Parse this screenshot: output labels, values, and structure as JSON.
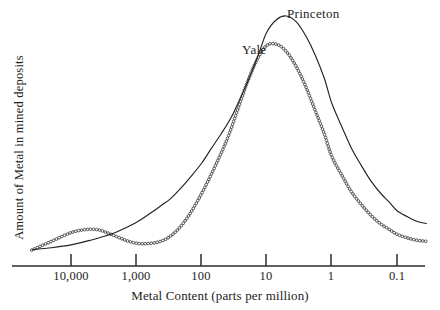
{
  "chart_data": {
    "type": "line",
    "title": "",
    "xlabel": "Metal Content (parts per million)",
    "ylabel": "Amount of Metal in mined deposits",
    "x_scale": "log-reversed",
    "x_ticks": [
      "10,000",
      "1,000",
      "100",
      "10",
      "1",
      "0.1"
    ],
    "x_tick_values": [
      10000,
      1000,
      100,
      10,
      1,
      0.1
    ],
    "xlim": [
      40000,
      0.03
    ],
    "ylim": [
      0,
      1.05
    ],
    "y_ticks": [],
    "grid": false,
    "legend": "inline-annotations",
    "annotations": [
      {
        "text": "Princeton",
        "x_px": 287,
        "y_px": 6
      },
      {
        "text": "Yale",
        "x_px": 242,
        "y_px": 42
      }
    ],
    "series": [
      {
        "name": "Princeton",
        "style": "solid-line",
        "color": "#232323",
        "shape": "unimodal",
        "peak_x_ppm": 10,
        "peak_value": 1.0,
        "x": [
          40000,
          20000,
          10000,
          5000,
          3000,
          2000,
          1000,
          600,
          400,
          300,
          200,
          150,
          100,
          70,
          50,
          35,
          25,
          18,
          13,
          10,
          7,
          5,
          3.5,
          2.5,
          1.8,
          1.3,
          1,
          0.7,
          0.5,
          0.35,
          0.25,
          0.18,
          0.13,
          0.1,
          0.07,
          0.05,
          0.035
        ],
        "values": [
          0.01,
          0.018,
          0.03,
          0.05,
          0.068,
          0.085,
          0.125,
          0.165,
          0.2,
          0.225,
          0.275,
          0.315,
          0.375,
          0.44,
          0.5,
          0.57,
          0.655,
          0.745,
          0.845,
          0.93,
          0.985,
          1.0,
          0.975,
          0.915,
          0.835,
          0.735,
          0.63,
          0.53,
          0.44,
          0.365,
          0.3,
          0.25,
          0.21,
          0.175,
          0.15,
          0.13,
          0.12
        ]
      },
      {
        "name": "Yale",
        "style": "open-circle-markers",
        "color": "#2a2a2a",
        "shape": "bimodal",
        "primary_peak_x_ppm": 13,
        "primary_peak_value": 0.88,
        "secondary_peak_x_ppm": 4000,
        "secondary_peak_value": 0.095,
        "x": [
          40000,
          20000,
          10000,
          6000,
          4000,
          3000,
          2000,
          1200,
          800,
          500,
          350,
          250,
          180,
          130,
          90,
          60,
          40,
          28,
          20,
          14,
          10,
          7,
          5,
          3.5,
          2.5,
          1.8,
          1.3,
          1,
          0.7,
          0.5,
          0.35,
          0.25,
          0.18,
          0.13,
          0.1,
          0.07,
          0.05,
          0.035
        ],
        "values": [
          0.008,
          0.045,
          0.082,
          0.095,
          0.095,
          0.085,
          0.065,
          0.042,
          0.035,
          0.04,
          0.055,
          0.085,
          0.13,
          0.19,
          0.27,
          0.37,
          0.48,
          0.6,
          0.715,
          0.815,
          0.875,
          0.88,
          0.85,
          0.785,
          0.7,
          0.6,
          0.5,
          0.405,
          0.325,
          0.255,
          0.2,
          0.155,
          0.12,
          0.095,
          0.075,
          0.06,
          0.05,
          0.045
        ]
      }
    ]
  },
  "axes": {
    "x_title": "Metal Content (parts per million)",
    "y_title": "Amount of Metal in mined deposits",
    "ticks": [
      {
        "label": "10,000",
        "x_px": 71
      },
      {
        "label": "1,000",
        "x_px": 136
      },
      {
        "label": "100",
        "x_px": 201
      },
      {
        "label": "10",
        "x_px": 266
      },
      {
        "label": "1",
        "x_px": 331
      },
      {
        "label": "0.1",
        "x_px": 397
      }
    ]
  },
  "labels": {
    "princeton": "Princeton",
    "yale": "Yale"
  },
  "colors": {
    "background": "#ffffff",
    "ink": "#232323",
    "axis": "#2b2b2b"
  }
}
